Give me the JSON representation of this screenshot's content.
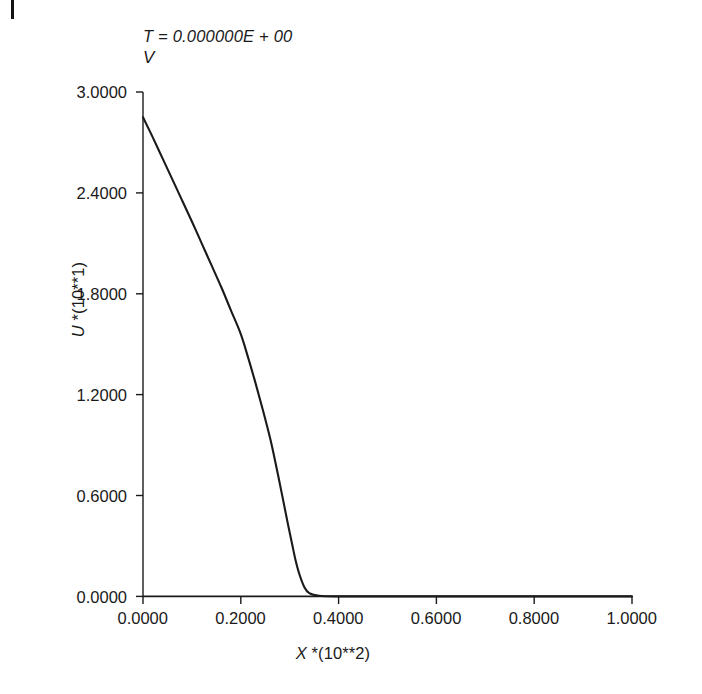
{
  "annotation": {
    "time_line": "T = 0.000000E + 00",
    "variable_line": "V"
  },
  "axes": {
    "y_title_italic": "U",
    "y_title_rest": " *(10**1)",
    "x_title_italic": "X",
    "x_title_rest": " *(10**2)",
    "y_ticks": [
      "3.0000",
      "2.4000",
      "1.8000",
      "1.2000",
      "0.6000",
      "0.0000"
    ],
    "x_ticks": [
      "0.0000",
      "0.2000",
      "0.4000",
      "0.6000",
      "0.8000",
      "1.0000"
    ],
    "line_color": "#1a1a1a",
    "background": "#ffffff"
  },
  "chart_data": {
    "type": "line",
    "title": "T = 0.000000E + 00",
    "subtitle": "V",
    "xlabel": "X *(10**2)",
    "ylabel": "U *(10**1)",
    "xlim": [
      0.0,
      1.0
    ],
    "ylim": [
      0.0,
      3.0
    ],
    "xticks": [
      0.0,
      0.2,
      0.4,
      0.6,
      0.8,
      1.0
    ],
    "yticks": [
      0.0,
      0.6,
      1.2,
      1.8,
      2.4,
      3.0
    ],
    "grid": false,
    "legend": null,
    "series": [
      {
        "name": "U(X)",
        "x": [
          0.0,
          0.02,
          0.04,
          0.06,
          0.08,
          0.1,
          0.12,
          0.14,
          0.16,
          0.18,
          0.2,
          0.215,
          0.23,
          0.245,
          0.26,
          0.272,
          0.284,
          0.295,
          0.305,
          0.312,
          0.32,
          0.33,
          0.34,
          0.36,
          0.4,
          0.5,
          0.6,
          0.7,
          0.8,
          0.9,
          1.0
        ],
        "y": [
          2.85,
          2.73,
          2.605,
          2.48,
          2.355,
          2.23,
          2.1,
          1.97,
          1.84,
          1.7,
          1.56,
          1.42,
          1.27,
          1.11,
          0.94,
          0.78,
          0.61,
          0.45,
          0.31,
          0.215,
          0.13,
          0.055,
          0.02,
          0.004,
          0.0,
          0.0,
          0.0,
          0.0,
          0.0,
          0.0,
          0.0
        ]
      }
    ]
  }
}
